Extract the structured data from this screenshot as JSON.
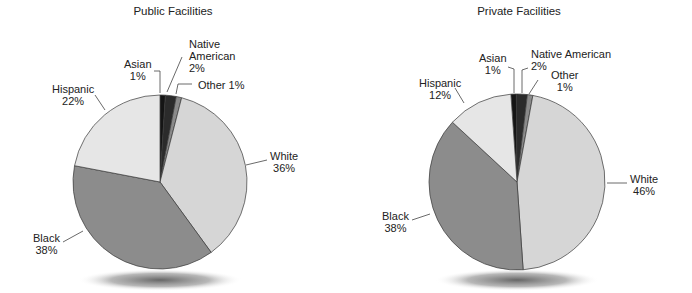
{
  "chart_data": [
    {
      "type": "pie",
      "title": "Public Facilities",
      "categories": [
        "Asian",
        "Native American",
        "Other",
        "White",
        "Black",
        "Hispanic"
      ],
      "values": [
        1,
        2,
        1,
        36,
        38,
        22
      ],
      "labels": [
        "Asian 1%",
        "Native American 2%",
        "Other 1%",
        "White 36%",
        "Black 38%",
        "Hispanic 22%"
      ],
      "start_angle_deg": 0,
      "direction": "clockwise",
      "legend": "none (direct labels with leader lines)"
    },
    {
      "type": "pie",
      "title": "Private Facilities",
      "categories": [
        "Asian",
        "Native American",
        "Other",
        "White",
        "Black",
        "Hispanic"
      ],
      "values": [
        1,
        2,
        1,
        46,
        38,
        12
      ],
      "labels": [
        "Asian 1%",
        "Native American 2%",
        "Other 1%",
        "White 46%",
        "Black 38%",
        "Hispanic 12%"
      ],
      "start_angle_deg": -4,
      "direction": "clockwise",
      "legend": "none (direct labels with leader lines)"
    }
  ],
  "colors": {
    "Asian": "#151515",
    "Native American": "#2b2b2b",
    "Other": "#8a8a8a",
    "White": "#d6d6d6",
    "Black": "#8c8c8c",
    "Hispanic": "#e6e6e6",
    "outline": "#3a3a3a"
  },
  "public": {
    "title": "Public Facilities",
    "labels": {
      "asian": {
        "name": "Asian",
        "pct": "1%"
      },
      "native": {
        "name1": "Native",
        "name2": "American",
        "pct": "2%"
      },
      "other": {
        "text": "Other 1%"
      },
      "white": {
        "name": "White",
        "pct": "36%"
      },
      "black": {
        "name": "Black",
        "pct": "38%"
      },
      "hispanic": {
        "name": "Hispanic",
        "pct": "22%"
      }
    }
  },
  "private": {
    "title": "Private Facilities",
    "labels": {
      "asian": {
        "name": "Asian",
        "pct": "1%"
      },
      "native": {
        "name": "Native American",
        "pct": "2%"
      },
      "other": {
        "name": "Other",
        "pct": "1%"
      },
      "white": {
        "name": "White",
        "pct": "46%"
      },
      "black": {
        "name": "Black",
        "pct": "38%"
      },
      "hispanic": {
        "name": "Hispanic",
        "pct": "12%"
      }
    }
  }
}
